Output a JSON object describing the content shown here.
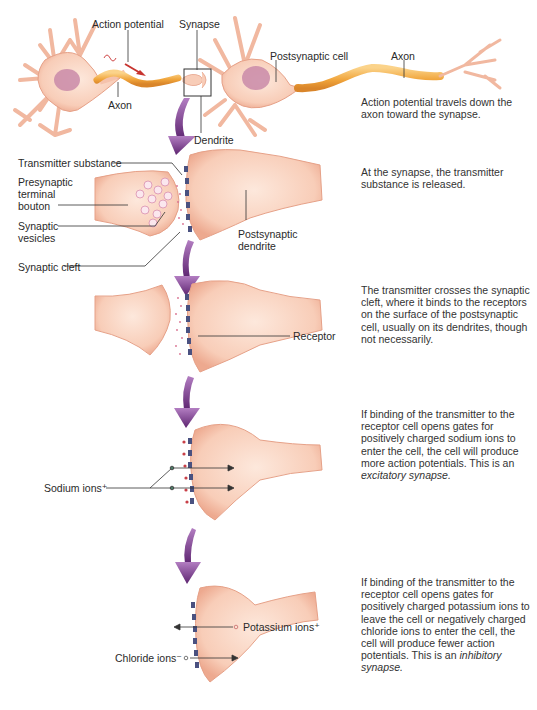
{
  "figure": {
    "colors": {
      "cell_body": "#f7c9b4",
      "cell_edge": "#e8a58c",
      "nucleus": "#c98aa8",
      "axon": "#f0a53c",
      "arrow": "#6a2c7c",
      "receptor": "#4a5180",
      "label_line": "#333333"
    }
  },
  "stages": [
    {
      "id": "neurons",
      "labels": {
        "action_potential": "Action potential",
        "synapse": "Synapse",
        "postsynaptic_cell": "Postsynaptic cell",
        "axon_right": "Axon",
        "axon_left": "Axon",
        "dendrite": "Dendrite"
      },
      "description": "Action potential travels down the axon toward the synapse."
    },
    {
      "id": "release",
      "labels": {
        "transmitter_substance": "Transmitter substance",
        "presynaptic_terminal_bouton_1": "Presynaptic",
        "presynaptic_terminal_bouton_2": "terminal",
        "presynaptic_terminal_bouton_3": "bouton",
        "synaptic_vesicles_1": "Synaptic",
        "synaptic_vesicles_2": "vesicles",
        "synaptic_cleft": "Synaptic cleft",
        "postsynaptic_dendrite_1": "Postsynaptic",
        "postsynaptic_dendrite_2": "dendrite"
      },
      "description": "At the synapse, the transmitter substance is released."
    },
    {
      "id": "binding",
      "labels": {
        "receptor": "Receptor"
      },
      "description": "The transmitter crosses the synaptic cleft, where it binds to the receptors on the surface of the postsynaptic cell, usually on its dendrites, though not necessarily."
    },
    {
      "id": "excitatory",
      "labels": {
        "sodium_ions": "Sodium ions⁺"
      },
      "description_plain": "If binding of the transmitter to the receptor cell opens gates for positively charged sodium ions to enter the cell, the cell will produce more action potentials. This is an ",
      "description_italic": "excitatory synapse."
    },
    {
      "id": "inhibitory",
      "labels": {
        "potassium_ions": "Potassium ions⁺",
        "chloride_ions": "Chloride ions⁻"
      },
      "description_plain": "If binding of the transmitter to the receptor cell opens gates for positively charged potassium ions to leave the cell or negatively charged chloride ions to enter the cell, the cell will produce fewer action potentials. This is an ",
      "description_italic": "inhibitory synapse."
    }
  ]
}
